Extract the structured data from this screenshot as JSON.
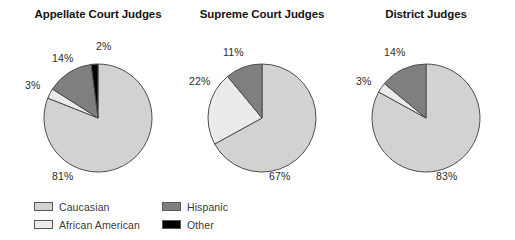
{
  "chart_data": {
    "type": "pie",
    "title": "",
    "legend_position": "bottom-left",
    "grid": false,
    "categories": [
      "Caucasian",
      "African American",
      "Hispanic",
      "Other"
    ],
    "colors": {
      "Caucasian": "#d2d2d2",
      "African American": "#ebebeb",
      "Hispanic": "#7f7f7f",
      "Other": "#000000",
      "outline": "#4d4d4d",
      "background": "#ffffff",
      "label_text": "#2b2b2b",
      "title_text": "#141414"
    },
    "charts": [
      {
        "title": "Appellate Court Judges",
        "slices": [
          {
            "label": "Caucasian",
            "value": 81,
            "display": "81%"
          },
          {
            "label": "African American",
            "value": 3,
            "display": "3%"
          },
          {
            "label": "Hispanic",
            "value": 14,
            "display": "14%"
          },
          {
            "label": "Other",
            "value": 2,
            "display": "2%"
          }
        ]
      },
      {
        "title": "Supreme Court Judges",
        "slices": [
          {
            "label": "Caucasian",
            "value": 67,
            "display": "67%"
          },
          {
            "label": "African American",
            "value": 22,
            "display": "22%"
          },
          {
            "label": "Hispanic",
            "value": 11,
            "display": "11%"
          },
          {
            "label": "Other",
            "value": 0,
            "display": ""
          }
        ]
      },
      {
        "title": "District Judges",
        "slices": [
          {
            "label": "Caucasian",
            "value": 83,
            "display": "83%"
          },
          {
            "label": "African American",
            "value": 3,
            "display": "3%"
          },
          {
            "label": "Hispanic",
            "value": 14,
            "display": "14%"
          },
          {
            "label": "Other",
            "value": 0,
            "display": ""
          }
        ]
      }
    ]
  },
  "panels": [
    {
      "title": "Appellate Court Judges",
      "labels": [
        {
          "text": "2%",
          "x": 84,
          "y": 40
        },
        {
          "text": "14%",
          "x": 40,
          "y": 52
        },
        {
          "text": "3%",
          "x": 13,
          "y": 79
        },
        {
          "text": "81%",
          "x": 40,
          "y": 170
        }
      ]
    },
    {
      "title": "Supreme Court Judges",
      "labels": [
        {
          "text": "11%",
          "x": 47,
          "y": 46
        },
        {
          "text": "22%",
          "x": 13,
          "y": 75
        },
        {
          "text": "67%",
          "x": 93,
          "y": 170
        }
      ]
    },
    {
      "title": "District Judges",
      "labels": [
        {
          "text": "14%",
          "x": 44,
          "y": 46
        },
        {
          "text": "3%",
          "x": 16,
          "y": 75
        },
        {
          "text": "83%",
          "x": 96,
          "y": 170
        }
      ]
    }
  ],
  "legend": {
    "columns": [
      [
        {
          "label": "Caucasian",
          "swatch": "#d2d2d2"
        },
        {
          "label": "African American",
          "swatch": "#ebebeb"
        }
      ],
      [
        {
          "label": "Hispanic",
          "swatch": "#7f7f7f"
        },
        {
          "label": "Other",
          "swatch": "#000000"
        }
      ]
    ]
  }
}
